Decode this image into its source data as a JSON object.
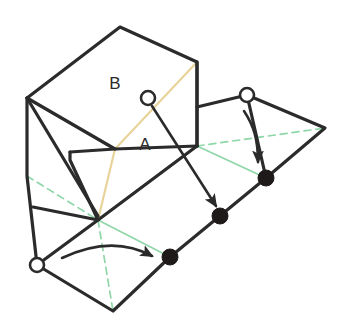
{
  "figure": {
    "background_color": "#ffffff",
    "width": 342,
    "height": 333,
    "colors": {
      "outline": "#2b2b2b",
      "fold_line": "#e8d49a",
      "hinge_line": "#8fd6a8",
      "label_text": "#2b2b2b",
      "marker_fill": "#1d1a19",
      "marker_open_fill": "#ffffff"
    },
    "labels": [
      {
        "id": "label-b",
        "text": "B",
        "x": 115,
        "y": 85
      },
      {
        "id": "label-a",
        "text": "A",
        "x": 145,
        "y": 146
      }
    ],
    "open_markers": [
      {
        "id": "open-marker-face",
        "x": 148,
        "y": 98,
        "r": 7
      },
      {
        "id": "open-marker-top-right",
        "x": 247,
        "y": 95,
        "r": 7
      },
      {
        "id": "open-marker-bottom-left",
        "x": 37,
        "y": 265,
        "r": 7
      }
    ],
    "filled_markers": [
      {
        "id": "filled-marker-upper",
        "x": 266,
        "y": 178,
        "r": 8
      },
      {
        "id": "filled-marker-middle",
        "x": 220,
        "y": 216,
        "r": 8
      },
      {
        "id": "filled-marker-lower",
        "x": 170,
        "y": 257,
        "r": 8
      }
    ],
    "outline_paths": [
      "M 27 98 L 120 27 L 197 62 L 197 146",
      "M 27 98 L 115 149 L 197 146",
      "M 27 98 L 27 176 L 37 265",
      "M 27 98 L 98 216",
      "M 33 207 L 98 220 L 70 160 L 70 152",
      "M 70 152 L 115 149",
      "M 197 146 L 98 220 L 37 265 L 113 311 L 170 257 L 266 178 L 247 95",
      "M 197 107 L 247 95 L 325 128 L 266 178",
      "M 197 62 L 197 146"
    ],
    "fold_paths": [
      "M 27 98 L 115 149 L 197 62",
      "M 115 149 L 98 220",
      "M 98 220 L 197 146"
    ],
    "hinge_solid_paths": [
      "M 98 220 L 170 257",
      "M 98 220 L 197 146 L 266 178"
    ],
    "hinge_dashed_paths": [
      "M 27 176 L 98 220",
      "M 98 220 L 113 311",
      "M 197 146 L 325 128"
    ],
    "arrows": [
      {
        "id": "arrow-face-to-middle",
        "path": "M 152 106 L 216 206",
        "description": "straight arrow from face circle to middle dot"
      },
      {
        "id": "arrow-top-right-rotate",
        "path": "M 244 111 C 254 126 258 140 258 162",
        "description": "curved rotation arrow from top-right circle down to upper dot"
      },
      {
        "id": "arrow-bottom-left-rotate",
        "path": "M 62 258 C 100 240 130 244 152 256",
        "description": "curved rotation arrow from bottom-left circle to lower dot"
      }
    ]
  }
}
